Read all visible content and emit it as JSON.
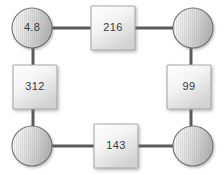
{
  "diagram": {
    "title": "",
    "type": "ring-network",
    "background_color": "#ffffff",
    "connector_color": "#5a5a5a",
    "connector_width": 3,
    "circle": {
      "fill_light": "#f2f2f2",
      "fill_dark": "#b9b9b9",
      "stroke": "#6e6e6e",
      "radius": 20
    },
    "square": {
      "fill_light": "#fdfdfd",
      "fill_dark": "#d5d5d5",
      "stroke": "#a8a8a8",
      "size": 44
    },
    "label_color": "#3b3b3b",
    "nodes": [
      {
        "id": "n1",
        "shape": "circle",
        "label": "4.8",
        "cx": 32,
        "cy": 28
      },
      {
        "id": "n2",
        "shape": "square",
        "label": "216",
        "cx": 113,
        "cy": 28
      },
      {
        "id": "n3",
        "shape": "circle",
        "label": "",
        "cx": 193,
        "cy": 28
      },
      {
        "id": "n4",
        "shape": "square",
        "label": "312",
        "cx": 35,
        "cy": 87
      },
      {
        "id": "n5",
        "shape": "square",
        "label": "99",
        "cx": 189,
        "cy": 87
      },
      {
        "id": "n6",
        "shape": "circle",
        "label": "",
        "cx": 32,
        "cy": 146
      },
      {
        "id": "n7",
        "shape": "square",
        "label": "143",
        "cx": 116,
        "cy": 146
      },
      {
        "id": "n8",
        "shape": "circle",
        "label": "",
        "cx": 193,
        "cy": 146
      }
    ],
    "edges": [
      {
        "from": "n1",
        "to": "n2",
        "orientation": "horizontal"
      },
      {
        "from": "n2",
        "to": "n3",
        "orientation": "horizontal"
      },
      {
        "from": "n1",
        "to": "n4",
        "orientation": "vertical"
      },
      {
        "from": "n3",
        "to": "n5",
        "orientation": "vertical"
      },
      {
        "from": "n4",
        "to": "n6",
        "orientation": "vertical"
      },
      {
        "from": "n5",
        "to": "n8",
        "orientation": "vertical"
      },
      {
        "from": "n6",
        "to": "n7",
        "orientation": "horizontal"
      },
      {
        "from": "n7",
        "to": "n8",
        "orientation": "horizontal"
      }
    ]
  }
}
